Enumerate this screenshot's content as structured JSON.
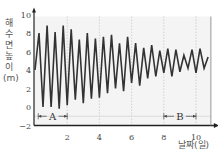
{
  "chart_data": {
    "type": "line",
    "title": "",
    "xlabel": "날짜(일)",
    "ylabel": "해수면 높이(m)",
    "xlim": [
      0,
      10.8
    ],
    "ylim": [
      -2,
      10
    ],
    "xticks": [
      2,
      4,
      6,
      8,
      10
    ],
    "yticks": [
      -2,
      0,
      2,
      4,
      6,
      8,
      10
    ],
    "grid": "vertical dashed at x ticks, horizontal at y=-1",
    "annotations": [
      {
        "label": "A",
        "x_start": 0.2,
        "x_end": 2.0,
        "y": -1
      },
      {
        "label": "B",
        "x_start": 8.0,
        "x_end": 10.0,
        "y": -1
      }
    ],
    "series": [
      {
        "name": "해수면 높이",
        "x": [
          0,
          0.25,
          0.5,
          0.75,
          1.0,
          1.25,
          1.5,
          1.75,
          2.0,
          2.25,
          2.5,
          2.75,
          3.0,
          3.25,
          3.5,
          3.75,
          4.0,
          4.25,
          4.5,
          4.75,
          5.0,
          5.25,
          5.5,
          5.75,
          6.0,
          6.25,
          6.5,
          6.75,
          7.0,
          7.25,
          7.5,
          7.75,
          8.0,
          8.25,
          8.5,
          8.75,
          9.0,
          9.25,
          9.5,
          9.75,
          10.0,
          10.25,
          10.5,
          10.75
        ],
        "values": [
          4,
          8,
          0,
          8.8,
          0,
          8.1,
          -0.2,
          8.8,
          0.2,
          8.4,
          0.8,
          7.3,
          0.4,
          8.0,
          0.9,
          7.4,
          1.0,
          7.6,
          1.5,
          7.8,
          2.0,
          6.9,
          1.7,
          7.6,
          2.6,
          6.9,
          2.3,
          6.4,
          3.1,
          6.7,
          3.3,
          6.1,
          3.7,
          6.3,
          3.3,
          6.2,
          3.8,
          5.6,
          4.2,
          6.2,
          3.7,
          6.3,
          4.2,
          5.4
        ]
      }
    ]
  },
  "labels": {
    "ylabel": "해수면 높이(m)",
    "xlabel": "날짜(일)",
    "A": "A",
    "B": "B"
  }
}
